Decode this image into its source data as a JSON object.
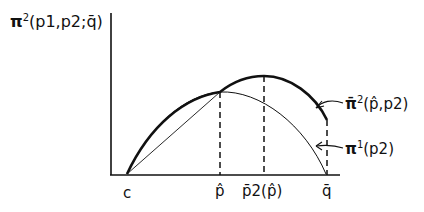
{
  "diagram": {
    "y_axis_label": {
      "prefix": "π",
      "superscript": "2",
      "args": "(p1,p2;q̄)"
    },
    "curves": [
      {
        "id": "upper",
        "label_prefix": "π̄",
        "label_superscript": "2",
        "label_args": "(p̂,p2)"
      },
      {
        "id": "lower",
        "label_prefix": "π",
        "label_superscript": "1",
        "label_args": "(p2)"
      }
    ],
    "x_ticks": [
      "c",
      "p̂",
      "p̄2(p̂)",
      "q̄"
    ],
    "colors": {
      "ink": "#111111",
      "background": "#ffffff"
    }
  }
}
